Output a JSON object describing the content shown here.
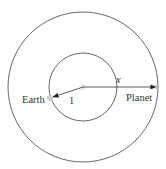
{
  "diagram": {
    "center": {
      "x": 83,
      "y": 87
    },
    "outer_orbit": {
      "r": 75
    },
    "inner_orbit": {
      "r": 34
    },
    "labels": {
      "earth": "Earth",
      "planet": "Planet",
      "inner_radius": "1",
      "outer_radius": "x"
    },
    "colors": {
      "line": "#555555",
      "sun": "#d8d8d8",
      "body": "#c8c8c8"
    }
  }
}
